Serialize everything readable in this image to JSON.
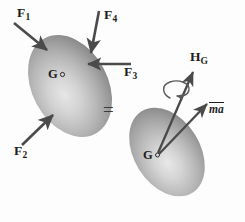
{
  "figure": {
    "caption": "",
    "equals_sign": "=",
    "bodies": [
      {
        "name": "loaded-body",
        "center_label": "G",
        "center_marker": "○"
      },
      {
        "name": "kinetic-body",
        "center_label": "G",
        "center_marker": "○"
      }
    ],
    "force_labels": [
      {
        "base": "F",
        "sub": "1"
      },
      {
        "base": "F",
        "sub": "4"
      },
      {
        "base": "F",
        "sub": "3"
      },
      {
        "base": "F",
        "sub": "2"
      }
    ],
    "kinetic_labels": {
      "angular_momentum": {
        "base": "H",
        "sub": "G"
      },
      "linear_momentum": "ma"
    },
    "colors": {
      "body_fill_light": "#dcdcdc",
      "body_fill_mid": "#b4b4b4",
      "body_fill_dark": "#8e8e8e",
      "arrow": "#4a4a4a",
      "text": "#1d1d1d",
      "background": "#fdfdfd"
    }
  }
}
